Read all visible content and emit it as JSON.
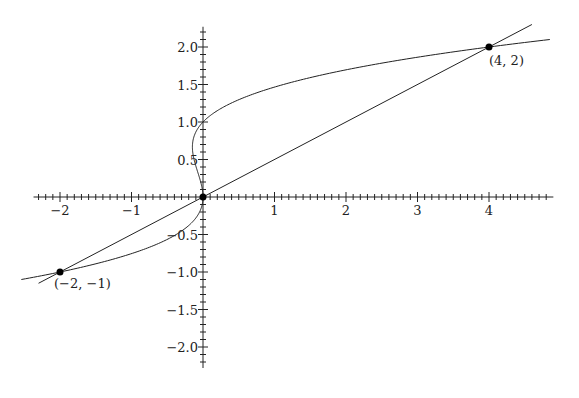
{
  "chart_data": {
    "type": "line",
    "title": "",
    "xlabel": "",
    "ylabel": "",
    "xlim": [
      -2.37,
      4.9
    ],
    "ylim": [
      -2.28,
      2.27
    ],
    "grid": false,
    "legend": null,
    "x_ticks": [
      "−2",
      "−1",
      "1",
      "2",
      "3",
      "4"
    ],
    "x_tick_values": [
      -2,
      -1,
      1,
      2,
      3,
      4
    ],
    "y_ticks": [
      "2.0",
      "1.5",
      "1.0",
      "0.5",
      "−0.5",
      "−1.0",
      "−1.5",
      "−2.0"
    ],
    "y_tick_values": [
      2.0,
      1.5,
      1.0,
      0.5,
      -0.5,
      -1.0,
      -1.5,
      -2.0
    ],
    "series": [
      {
        "name": "curve x = y^3 - y^2",
        "kind": "parametric-in-y",
        "y_range": [
          -1.1,
          2.1
        ]
      },
      {
        "name": "line y = x/2",
        "kind": "line",
        "x_range": [
          -2.3,
          4.6
        ]
      }
    ],
    "points": [
      {
        "x": -2,
        "y": -1,
        "label": "(−2, −1)"
      },
      {
        "x": 0,
        "y": 0,
        "label": ""
      },
      {
        "x": 4,
        "y": 2,
        "label": "(4, 2)"
      }
    ]
  },
  "labels": {
    "p1": "(−2, −1)",
    "p3": "(4, 2)",
    "xt": [
      "−2",
      "−1",
      "1",
      "2",
      "3",
      "4"
    ],
    "yt": [
      "2.0",
      "1.5",
      "1.0",
      "0.5",
      "−0.5",
      "−1.0",
      "−1.5",
      "−2.0"
    ]
  }
}
